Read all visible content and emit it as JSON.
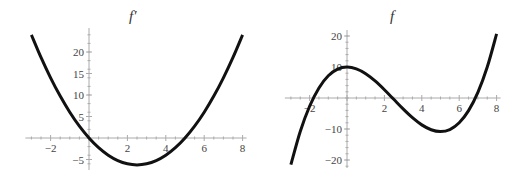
{
  "chart_data": [
    {
      "type": "line",
      "title": "f′",
      "xlabel": "",
      "ylabel": "",
      "xlim": [
        -3,
        8
      ],
      "ylim": [
        -6.5,
        25
      ],
      "xticks": [
        -2,
        2,
        4,
        6,
        8
      ],
      "yticks": [
        -5,
        5,
        10,
        15,
        20
      ],
      "grid": false,
      "legend": null,
      "series": [
        {
          "name": "f′",
          "x": [
            -3,
            -2.5,
            -2,
            -1.5,
            -1,
            -0.5,
            0,
            0.5,
            1,
            1.5,
            2,
            2.5,
            3,
            3.5,
            4,
            4.5,
            5,
            5.5,
            6,
            6.5,
            7,
            7.5,
            8
          ],
          "y": [
            24,
            18.75,
            14,
            9.75,
            6,
            2.75,
            0,
            -2.25,
            -4,
            -5.25,
            -6,
            -6.25,
            -6,
            -5.25,
            -4,
            -2.25,
            0,
            2.75,
            6,
            9.75,
            14,
            18.75,
            24
          ]
        }
      ],
      "layout": {
        "origin_px": [
          89,
          138
        ],
        "px_per_x": 19.2,
        "px_per_y": 4.3,
        "ytick_major_px_extent": [
          28,
          170
        ]
      }
    },
    {
      "type": "line",
      "title": "f",
      "xlabel": "",
      "ylabel": "",
      "xlim": [
        -3,
        8
      ],
      "ylim": [
        -22,
        21
      ],
      "xticks": [
        -2,
        2,
        4,
        6,
        8
      ],
      "yticks": [
        -20,
        -10,
        10,
        20
      ],
      "grid": false,
      "legend": null,
      "series": [
        {
          "name": "f",
          "x": [
            -3,
            -2.5,
            -2,
            -1.5,
            -1,
            -0.5,
            0,
            0.5,
            1,
            1.5,
            2,
            2.5,
            3,
            3.5,
            4,
            4.5,
            5,
            5.5,
            6,
            6.5,
            7,
            7.5,
            8
          ],
          "y": [
            -21.5,
            -10.83,
            -2.67,
            3.25,
            7.17,
            9.33,
            10,
            9.42,
            7.83,
            5.5,
            2.67,
            -0.42,
            -3.5,
            -6.33,
            -8.67,
            -10.25,
            -10.83,
            -10.17,
            -8,
            -4.08,
            1.83,
            9.98,
            20.67
          ]
        }
      ],
      "layout": {
        "origin_px": [
          86,
          98
        ],
        "px_per_x": 18.7,
        "px_per_y": 3.1,
        "ytick_major_px_extent": [
          30,
          168
        ]
      }
    }
  ],
  "titles": {
    "left": "f′",
    "right": "f"
  }
}
